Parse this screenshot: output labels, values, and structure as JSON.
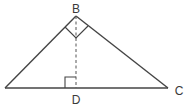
{
  "diagram": {
    "type": "geometry-triangle",
    "stroke_color": "#444444",
    "vertices": {
      "left": {
        "x": 5,
        "y": 88,
        "label": ""
      },
      "B": {
        "x": 76,
        "y": 16,
        "label": "B"
      },
      "C": {
        "x": 168,
        "y": 88,
        "label": "C"
      },
      "D": {
        "x": 76,
        "y": 88,
        "label": "D"
      }
    },
    "labels": [
      {
        "id": "B",
        "text": "B",
        "x": 76,
        "y": 8
      },
      {
        "id": "C",
        "text": "C",
        "x": 179,
        "y": 91
      },
      {
        "id": "D",
        "text": "D",
        "x": 76,
        "y": 100
      }
    ],
    "segments": [
      {
        "from": "left",
        "to": "B",
        "style": "solid"
      },
      {
        "from": "B",
        "to": "C",
        "style": "solid"
      },
      {
        "from": "left",
        "to": "C",
        "style": "solid"
      },
      {
        "from": "B",
        "to": "D",
        "style": "dashed"
      }
    ],
    "right_angle_marks": [
      {
        "at": "B"
      },
      {
        "at": "D"
      }
    ]
  }
}
